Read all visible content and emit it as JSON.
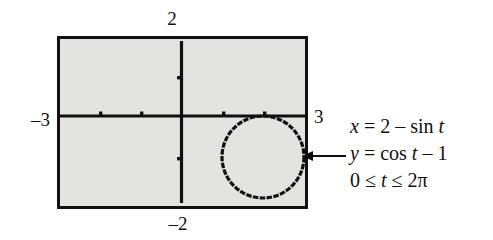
{
  "figure": {
    "kind": "parametric-plot",
    "colors": {
      "plot_background": "#e3e3e2",
      "frame": "#111111",
      "axis": "#101010",
      "curve": "#101010",
      "page_background": "#ffffff"
    },
    "axis_labels": {
      "top": "2",
      "bottom": "–2",
      "left": "–3",
      "right": "3"
    },
    "equations": [
      {
        "id": "x-equation",
        "text": "x = 2 – sin t"
      },
      {
        "id": "y-equation",
        "text": "y = cos t – 1"
      },
      {
        "id": "t-range",
        "text": "0 ≤ t ≤ 2π"
      }
    ],
    "annotation": {
      "arrow_name": "curve-callout-arrow",
      "direction": "left"
    }
  },
  "chart_data": {
    "type": "line",
    "title": "",
    "xlabel": "",
    "ylabel": "",
    "xlim": [
      -3,
      3
    ],
    "ylim": [
      -2,
      2
    ],
    "grid": false,
    "legend": false,
    "axis_tick_values": {
      "x": [
        -3,
        -2,
        -1,
        0,
        1,
        2,
        3
      ],
      "y": [
        -2,
        -1,
        0,
        1,
        2
      ]
    },
    "axis_labels_shown": {
      "x_min": "–3",
      "x_max": "3",
      "y_min": "–2",
      "y_max": "2"
    },
    "parametric": {
      "x_expression": "2 - sin(t)",
      "y_expression": "cos(t) - 1",
      "t_min": 0,
      "t_max": 6.283185307179586,
      "t_label_min": "0",
      "t_label_max": "2π",
      "shape": "circle",
      "center": [
        2,
        -1
      ],
      "radius": 1
    },
    "series": [
      {
        "name": "x = 2 - sin t, y = cos t - 1",
        "x": [
          2.0,
          1.707,
          1.5,
          1.293,
          1.0,
          1.293,
          1.5,
          1.707,
          2.0,
          2.293,
          2.5,
          2.707,
          3.0,
          2.707,
          2.5,
          2.293,
          2.0
        ],
        "y": [
          0.0,
          -0.293,
          -1.0,
          -1.707,
          -2.0,
          -1.707,
          -1.0,
          -0.293,
          0.0,
          -0.293,
          -1.0,
          -1.707,
          -2.0,
          -1.707,
          -1.0,
          -0.293,
          0.0
        ]
      }
    ]
  }
}
